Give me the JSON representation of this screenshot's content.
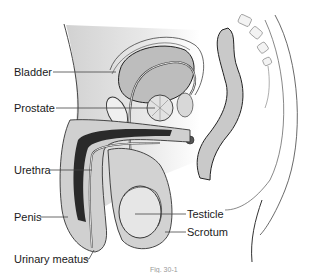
{
  "diagram": {
    "labels": [
      {
        "id": "bladder",
        "text": "Bladder"
      },
      {
        "id": "prostate",
        "text": "Prostate"
      },
      {
        "id": "urethra",
        "text": "Urethra"
      },
      {
        "id": "penis",
        "text": "Penis"
      },
      {
        "id": "urinary-meatus",
        "text": "Urinary meatus"
      },
      {
        "id": "testicle",
        "text": "Testicle"
      },
      {
        "id": "scrotum",
        "text": "Scrotum"
      }
    ],
    "caption": "Fig. 30-1"
  },
  "colors": {
    "tissue": "#d0d0d0",
    "tissue_light": "#e6e6e6",
    "dark_tissue": "#2a2a2a",
    "outline": "#333333",
    "leader": "#444444"
  }
}
